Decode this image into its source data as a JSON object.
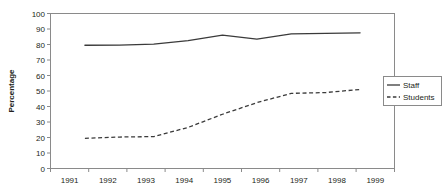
{
  "chart_data": {
    "type": "line",
    "title": "",
    "xlabel": "",
    "ylabel": "Percentage",
    "categories": [
      "1991",
      "1992",
      "1993",
      "1994",
      "1995",
      "1996",
      "1997",
      "1998",
      "1999"
    ],
    "series": [
      {
        "name": "Staff",
        "style": "solid",
        "color": "#3a3a3a",
        "values": [
          79.5,
          79.6,
          80.2,
          82.5,
          86.0,
          83.5,
          86.8,
          87.2,
          87.5
        ]
      },
      {
        "name": "Students",
        "style": "dashed",
        "color": "#3a3a3a",
        "values": [
          19.5,
          20.3,
          20.6,
          26.5,
          35.0,
          42.5,
          48.5,
          49.0,
          51.0
        ]
      }
    ],
    "ylim": [
      0,
      100
    ],
    "ytick_step": 10,
    "ytick_labels": [
      "0",
      "10",
      "20",
      "30",
      "40",
      "50",
      "60",
      "70",
      "80",
      "90",
      "100"
    ],
    "grid": false,
    "legend_position": "right",
    "legend_entries": [
      "Staff",
      "Students"
    ],
    "axis_color": "#8a8a8a",
    "text_color": "#231f20",
    "background": "#ffffff"
  }
}
